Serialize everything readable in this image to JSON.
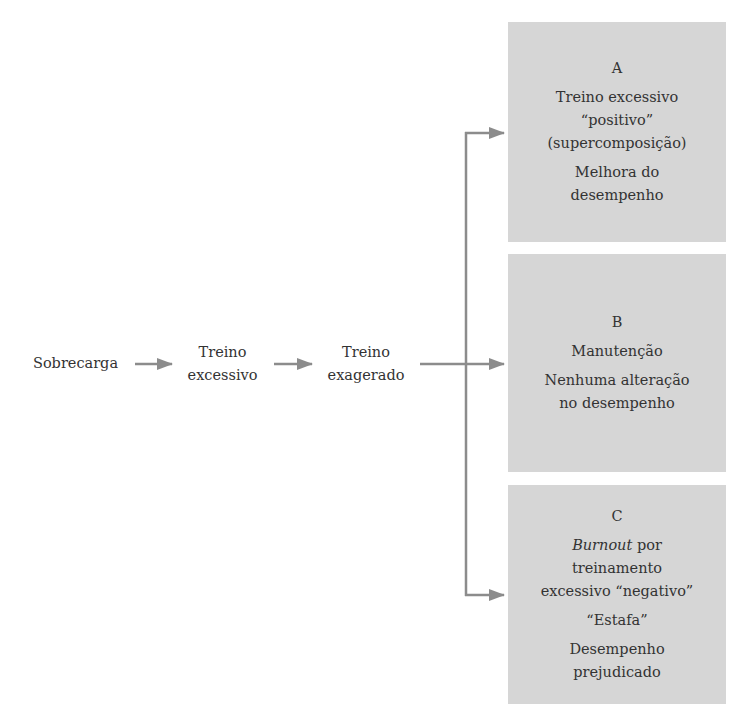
{
  "colors": {
    "box_fill": "#d6d6d6",
    "arrow": "#8c8c8c",
    "text": "#333333",
    "background": "#ffffff"
  },
  "flow": [
    {
      "id": "sobrecarga",
      "lines": [
        "Sobrecarga"
      ]
    },
    {
      "id": "treino-excessivo",
      "lines": [
        "Treino",
        "excessivo"
      ]
    },
    {
      "id": "treino-exagerado",
      "lines": [
        "Treino",
        "exagerado"
      ]
    }
  ],
  "outcomes": {
    "A": {
      "letter": "A",
      "title_lines": [
        "Treino excessivo",
        "“positivo”",
        "(supercomposição)"
      ],
      "result_lines": [
        "Melhora do",
        "desempenho"
      ]
    },
    "B": {
      "letter": "B",
      "title_lines": [
        "Manutenção"
      ],
      "result_lines": [
        "Nenhuma alteração",
        "no desempenho"
      ]
    },
    "C": {
      "letter": "C",
      "title_italic": "Burnout",
      "title_rest": " por",
      "title_lines": [
        "treinamento",
        "excessivo “negativo”"
      ],
      "alias": "“Estafa”",
      "result_lines": [
        "Desempenho",
        "prejudicado"
      ]
    }
  }
}
